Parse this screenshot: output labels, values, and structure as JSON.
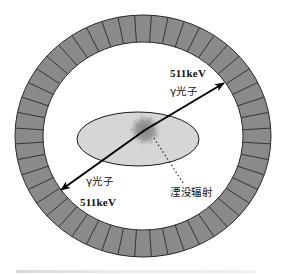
{
  "diagram": {
    "ring": {
      "center": [
        143,
        136
      ],
      "outer_rx": 128,
      "outer_ry": 121,
      "inner_rx": 100,
      "inner_ry": 94,
      "segment_count": 48,
      "fill_color": "#8a8a8a",
      "line_color": "#2a2a2a"
    },
    "body_ellipse": {
      "center": [
        138,
        139
      ],
      "rx": 61,
      "ry": 27,
      "fill_color": "#d6d6d6",
      "stroke_color": "#1a1a1a"
    },
    "annihilation_point": {
      "center": [
        145,
        130
      ],
      "color": "#8c8c8c"
    },
    "photon_top": {
      "energy_label": "511keV",
      "particle_label": "γ光子"
    },
    "photon_bottom": {
      "particle_label": "γ光子",
      "energy_label": "511keV"
    },
    "annihilation_label": "湮没辐射",
    "caption": ""
  }
}
